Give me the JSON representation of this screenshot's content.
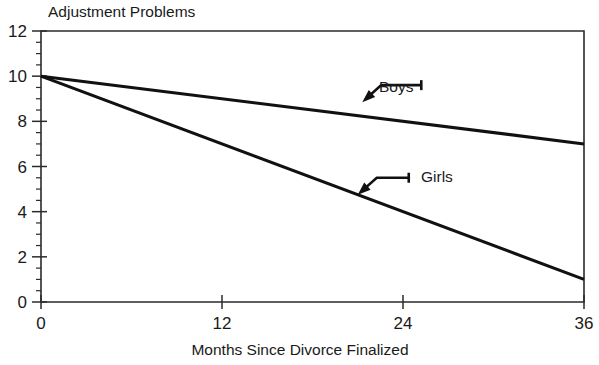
{
  "chart_data": {
    "type": "line",
    "title": "Adjustment Problems",
    "subtitle": "",
    "xlabel": "Months Since Divorce Finalized",
    "ylabel": "Adjustment Problems",
    "xlim": [
      0,
      36
    ],
    "ylim": [
      0,
      12
    ],
    "x_ticks": [
      0,
      12,
      24,
      36
    ],
    "x_tick_labels": [
      "0",
      "12",
      "24",
      "36"
    ],
    "y_ticks": [
      0,
      2,
      4,
      6,
      8,
      10,
      12
    ],
    "y_tick_labels": [
      "0",
      "2",
      "4",
      "6",
      "8",
      "10",
      "12"
    ],
    "y_minor_step": 0.5,
    "grid": false,
    "legend_position": "inline-annotation",
    "x": [
      0,
      36
    ],
    "series": [
      {
        "name": "Boys",
        "values": [
          10,
          7
        ],
        "label": "Boys",
        "label_x": 379,
        "label_y": 92,
        "color": "#111111"
      },
      {
        "name": "Girls",
        "values": [
          10,
          1
        ],
        "label": "Girls",
        "label_x": 421,
        "label_y": 182,
        "color": "#111111"
      }
    ],
    "annotations": [
      {
        "text": "Boys",
        "target_x": 21.3,
        "target_y": 8.85,
        "elbow": "horizontal-then-diagonal"
      },
      {
        "text": "Girls",
        "target_x": 21.0,
        "target_y": 4.75,
        "elbow": "horizontal-then-diagonal"
      }
    ]
  },
  "figure": {
    "title_x": 48,
    "title_y": 17,
    "xlabel_x": 300,
    "xlabel_y": 355
  }
}
